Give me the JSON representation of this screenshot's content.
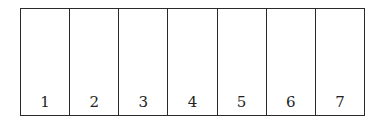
{
  "cells": [
    {
      "label": "1"
    },
    {
      "label": "2"
    },
    {
      "label": "3"
    },
    {
      "label": "4"
    },
    {
      "label": "5"
    },
    {
      "label": "6"
    },
    {
      "label": "7"
    }
  ]
}
